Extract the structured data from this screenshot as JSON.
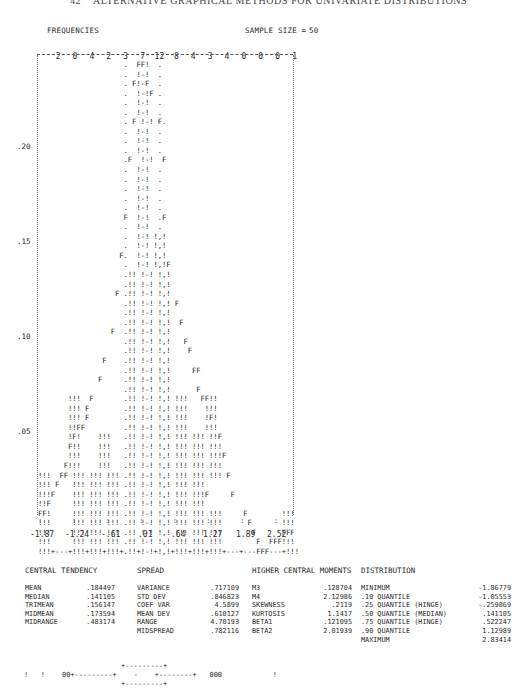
{
  "page": {
    "header": "42    ALTERNATIVE GRAPHICAL METHODS FOR UNIVARIATE DISTRIBUTIONS"
  },
  "histogram": {
    "frequencies_label": "FREQUENCIES",
    "sample_size_label": "SAMPLE SIZE =",
    "sample_size": "50",
    "frequency_counts": [
      "2",
      "0",
      "4",
      "2",
      "3",
      "7",
      "12",
      "8",
      "4",
      "3",
      "4",
      "0",
      "0",
      "0",
      "1"
    ],
    "y_labels": [
      ".20",
      ".15",
      ".10",
      ".05"
    ],
    "x_labels": [
      "-1.87",
      "-1.24",
      "-.61",
      ".01",
      ".64",
      "1.27",
      "1.89",
      "2.52"
    ],
    "rows": [
      "                    .  FF!  .",
      "                    .  !-!  .",
      "                    . F!-F  .",
      "                    .  !-!F .",
      "                    .  !-!  .",
      "                    .  !-!  .",
      "                    . F !-! F.",
      "                    .  !-!  .",
      "                    .  !-!  .",
      "                    .  !-!  .",
      "                    .F  !-!  F",
      "                    .  !-!  .",
      "                    .  !-!  .",
      "                    .  !-!  .",
      "                    .  !-!  .",
      "                    .  !-!  .",
      "                    F  !-!  .F",
      "                    .  !-!  .",
      "                    .  !-! !,!",
      "                    .  !-! !,!",
      "                   F.  !-! !,!",
      "                    .  !-! !,!F",
      "                    .!! !-! !,!",
      "                    .!! !-! !,!",
      "                  F .!! !-! !,!",
      "                    .!! !-! !,! F",
      "                    .!! !-! !,!",
      "                    .!! !-! !,!  F",
      "                 F  .!! !-! !,!",
      "                    .!! !-! !,!   F",
      "                    .!! !-! !,!    F",
      "               F    .!! !-! !,!",
      "                    .!! !-! !,!     FF",
      "              F     .!! !-! !,!",
      "                    .!! !-! !,!      F",
      "       !!!  F       .!! !-! !,! !!!   FF!!",
      "       !!! F        .!! !-! !,! !!!    !!!",
      "       !!! F        .!! !-! !,! !!!    !F!",
      "       !!FF         .!! !-! !,! !!!    !!!",
      "       !F!    !!!   .!! !-! !,! !!! !!! !!F",
      "       F!!    !!!   .!! !-! !,! !!! !!! !!!",
      "       !!!    !!!   .!! !-! !,! !!! !!! !!!F",
      "      F!!!    !!!   .!! !-! !,! !!! !!! !!!",
      "!!!  FF !!! !!! !!! .!! !-! !,! !!! !!! !!! F",
      "!!! F   !!! !!! !!! .!! !-! !,! !!! !!!",
      "!!!F    !!! !!! !!! .!! !-! !,! !!! !!!F     F",
      "!!F     !!! !!! !!! .!! !-! !,! !!! !!!",
      "FF!     !!! !!! !!! .!! !-! !,! !!! !!! !!!     F        !!!",
      "!!!     !!! !!! !!! .!! !-! !,! !!! !!! !!!      F       !!!",
      "!!!     !!! !!! !!! .!! !-! !,! !!! !!! !!!       F      FFF",
      "!!!     !!! !!! !!! .!! !-! !,! !!! !!! !!!        F  FFF!!!",
      "!!!+---+!!!+!!!+!!!+.!!+!-!+!,!+!!!+!!!+!!!+---+---FFF---+!!!"
    ],
    "tick_marks": ":       :       :       :       :       :       :       :"
  },
  "chart_data": {
    "type": "bar",
    "title": "FREQUENCIES",
    "subtitle": "SAMPLE SIZE = 50",
    "categories": [
      "bin1",
      "bin2",
      "bin3",
      "bin4",
      "bin5",
      "bin6",
      "bin7",
      "bin8",
      "bin9",
      "bin10",
      "bin11",
      "bin12",
      "bin13",
      "bin14",
      "bin15"
    ],
    "values": [
      2,
      0,
      4,
      2,
      3,
      7,
      12,
      8,
      4,
      3,
      4,
      0,
      0,
      0,
      1
    ],
    "x_tick_labels": [
      "-1.87",
      "-1.24",
      "-.61",
      ".01",
      ".64",
      "1.27",
      "1.89",
      "2.52"
    ],
    "y_tick_labels": [
      ".05",
      ".10",
      ".15",
      ".20"
    ],
    "xlabel": "",
    "ylabel": "relative frequency",
    "ylim": [
      0,
      0.25
    ],
    "overlay": "fitted density curve (F) with dotted interval bars",
    "grid": false,
    "legend": "none"
  },
  "stats": {
    "central_tendency": {
      "title": "CENTRAL TENDENCY",
      "rows": [
        {
          "label": "MEAN",
          "value": ".184497"
        },
        {
          "label": "MEDIAN",
          "value": ".141105"
        },
        {
          "label": "TRIMEAN",
          "value": ".156147"
        },
        {
          "label": "MIDMEAN",
          "value": ".173594"
        },
        {
          "label": "MIDRANGE",
          "value": ".483174"
        }
      ]
    },
    "spread": {
      "title": "SPREAD",
      "rows": [
        {
          "label": "VARIANCE",
          "value": ".717109"
        },
        {
          "label": "STD DEV",
          "value": ".846823"
        },
        {
          "label": "COEF VAR",
          "value": "4.5899"
        },
        {
          "label": "MEAN DEV",
          "value": ".610127"
        },
        {
          "label": "RANGE",
          "value": "4.70193"
        },
        {
          "label": "MIDSPREAD",
          "value": ".782116"
        }
      ]
    },
    "moments": {
      "title": "HIGHER CENTRAL MOMENTS",
      "rows": [
        {
          "label": "M3",
          "value": ".128704"
        },
        {
          "label": "M4",
          "value": "2.12986"
        },
        {
          "label": "SKEWNESS",
          "value": ".2119"
        },
        {
          "label": "KURTOSIS",
          "value": "1.1417"
        },
        {
          "label": "BETA1",
          "value": ".121095"
        },
        {
          "label": "BETA2",
          "value": "2.01939"
        }
      ]
    },
    "distribution": {
      "title": "DISTRIBUTION",
      "rows": [
        {
          "label": "MINIMUM",
          "value": "-1.86779"
        },
        {
          "label": ".10 QUANTILE",
          "value": "-1.05553"
        },
        {
          "label": ".25 QUANTILE (HINGE)",
          "value": "-.259869"
        },
        {
          "label": ".50 QUANTILE (MEDIAN)",
          "value": ".141105"
        },
        {
          "label": ".75 QUANTILE (HINGE)",
          "value": ".522247"
        },
        {
          "label": ".90 QUANTILE",
          "value": "1.12989"
        },
        {
          "label": "MAXIMUM",
          "value": "2.83414"
        }
      ]
    }
  },
  "boxplot": {
    "lines": [
      "                       +---------+",
      "!   !    00+---------+    -    +--------+   000            !",
      "                       +---------+"
    ]
  }
}
